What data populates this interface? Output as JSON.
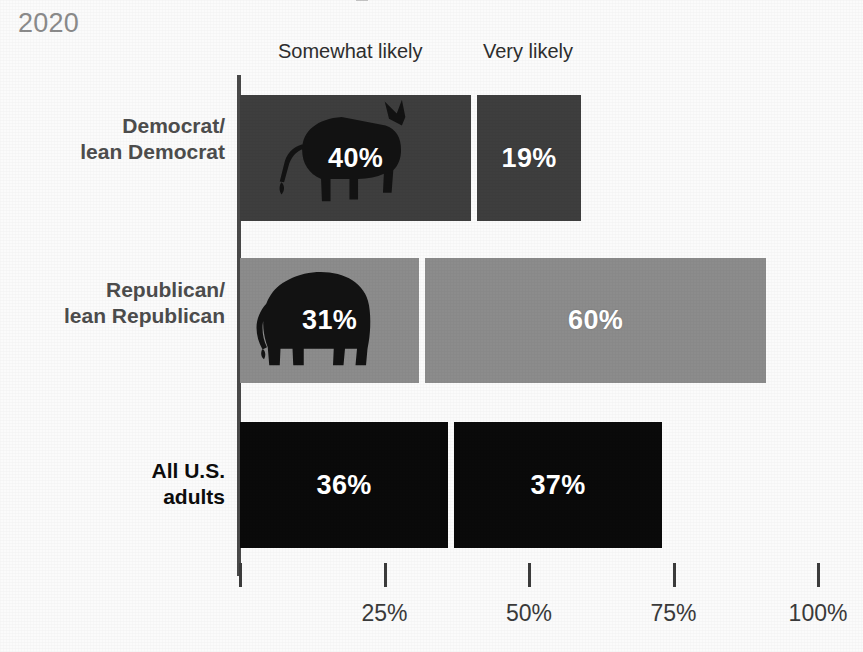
{
  "header": {
    "year": "2020"
  },
  "legend": {
    "items": [
      {
        "label": "Somewhat likely"
      },
      {
        "label": "Very likely"
      }
    ]
  },
  "chart_data": {
    "type": "bar",
    "orientation": "horizontal",
    "stacked": true,
    "title": "2020",
    "xlabel": "",
    "ylabel": "",
    "xlim": [
      0,
      100
    ],
    "grid": false,
    "legend_position": "top",
    "categories": [
      "Democrat/\nlean Democrat",
      "Republican/\nlean Republican",
      "All U.S.\nadults"
    ],
    "category_lines": [
      [
        "Democrat/",
        "lean Democrat"
      ],
      [
        "Republican/",
        "lean Republican"
      ],
      [
        "All U.S.",
        "adults"
      ]
    ],
    "series": [
      {
        "name": "Somewhat likely",
        "values": [
          40,
          31,
          36
        ],
        "labels": [
          "40%",
          "31%",
          "36%"
        ]
      },
      {
        "name": "Very likely",
        "values": [
          19,
          60,
          37
        ],
        "labels": [
          "19%",
          "60%",
          "37%"
        ]
      }
    ],
    "series_colors_by_category": [
      "#3e3e3e",
      "#8c8c8c",
      "#0a0a0a"
    ],
    "icon_by_category": [
      "donkey-icon",
      "elephant-icon",
      null
    ],
    "icon_color": "#121212",
    "ticks": [
      {
        "value": 0,
        "label": ""
      },
      {
        "value": 25,
        "label": "25%"
      },
      {
        "value": 50,
        "label": "50%"
      },
      {
        "value": 75,
        "label": "75%"
      },
      {
        "value": 100,
        "label": "100%"
      }
    ]
  },
  "colors": {
    "democrat_bar": "#3e3e3e",
    "republican_bar": "#8c8c8c",
    "all_adults_bar": "#0a0a0a",
    "axis": "#4a4a4a",
    "year_text": "#8b8b8b",
    "value_text": "#ffffff"
  }
}
